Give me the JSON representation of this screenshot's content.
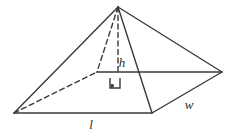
{
  "figure": {
    "name": "rectangular-pyramid-diagram",
    "background_color": "#ffffff",
    "stroke_color": "#3a3a3a",
    "label_color": "#2b2b2b",
    "stroke_width": 1.4,
    "dash_pattern": "5 3.5"
  },
  "labels": {
    "length": "l",
    "width": "w",
    "height": "h"
  },
  "label_positions": {
    "length": {
      "x": 91,
      "y": 129
    },
    "width": {
      "x": 189,
      "y": 109
    },
    "height": {
      "x": 122,
      "y": 67
    }
  },
  "vertices": {
    "apex": {
      "x": 118,
      "y": 7,
      "name": "apex"
    },
    "front_left": {
      "x": 14,
      "y": 113,
      "name": "front-left-base-corner"
    },
    "front_right": {
      "x": 152,
      "y": 113,
      "name": "front-right-base-corner"
    },
    "back_right": {
      "x": 222,
      "y": 72,
      "name": "back-right-base-corner"
    },
    "back_left": {
      "x": 97,
      "y": 72,
      "name": "back-left-base-corner"
    },
    "height_foot": {
      "x": 118,
      "y": 72,
      "name": "height-foot-point"
    }
  },
  "edges": [
    {
      "name": "edge-apex-to-front-left",
      "style": "solid",
      "from": "apex",
      "to": "front_left"
    },
    {
      "name": "edge-apex-to-front-right",
      "style": "solid",
      "from": "apex",
      "to": "front_right"
    },
    {
      "name": "edge-apex-to-back-right",
      "style": "solid",
      "from": "apex",
      "to": "back_right"
    },
    {
      "name": "edge-base-front-length",
      "style": "solid",
      "from": "front_left",
      "to": "front_right"
    },
    {
      "name": "edge-base-front-width",
      "style": "solid",
      "from": "front_right",
      "to": "back_right"
    },
    {
      "name": "edge-base-back-width",
      "style": "solid",
      "from": "back_left",
      "to": "back_right"
    },
    {
      "name": "edge-apex-to-back-left",
      "style": "dashed",
      "from": "apex",
      "to": "back_left"
    },
    {
      "name": "edge-base-back-length",
      "style": "dashed",
      "from": "front_left",
      "to": "back_left"
    },
    {
      "name": "edge-height-altitude",
      "style": "dashed",
      "from": "apex",
      "to": "height_foot"
    }
  ],
  "right_angle_marker": {
    "name": "right-angle-marker",
    "description": "square marker at foot of altitude indicating perpendicular",
    "x": 110,
    "y": 78,
    "size": 10,
    "dot_size": 3.2
  }
}
